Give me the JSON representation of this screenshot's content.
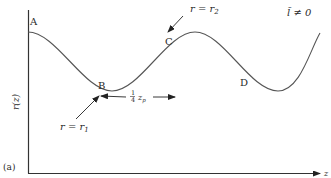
{
  "figure": {
    "panel_label": "(a)",
    "condition": "l̃ ≠ 0",
    "y_axis_label": "r(z)",
    "x_axis_label": "z",
    "points": [
      {
        "id": "A",
        "label": "A"
      },
      {
        "id": "B",
        "label": "B"
      },
      {
        "id": "C",
        "label": "C"
      },
      {
        "id": "D",
        "label": "D"
      }
    ],
    "annotations": {
      "min_radius": "r = r",
      "min_radius_sub": "1",
      "max_radius": "r = r",
      "max_radius_sub": "2",
      "quarter_period": "1",
      "quarter_period_den": "4",
      "quarter_period_var": "z",
      "quarter_period_sub": "p"
    },
    "colors": {
      "line": "#4a4a4a",
      "text": "#2a2a2a"
    }
  }
}
